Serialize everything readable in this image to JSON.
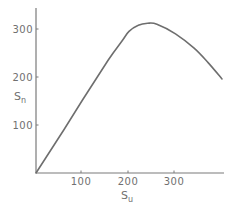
{
  "chart_data": {
    "type": "line",
    "title": "",
    "xlabel": "S_u",
    "ylabel": "S_n",
    "xlabel_main": "S",
    "xlabel_sub": "u",
    "ylabel_main": "S",
    "ylabel_sub": "n",
    "xticks": [
      "100",
      "200",
      "300"
    ],
    "yticks": [
      "100",
      "200",
      "300"
    ],
    "xlim": [
      0,
      405
    ],
    "ylim": [
      0,
      345
    ],
    "grid": false,
    "legend": null,
    "series": [
      {
        "name": "S_n vs S_u",
        "color": "#6e6e6e",
        "x": [
          0,
          60,
          100,
          155,
          185,
          200,
          220,
          240,
          260,
          300,
          340,
          370,
          400
        ],
        "y": [
          0,
          90,
          152,
          235,
          275,
          295,
          308,
          312,
          310,
          290,
          260,
          230,
          196
        ]
      }
    ]
  },
  "colors": {
    "axis": "#707070",
    "curve": "#6e6e6e",
    "background": "#ffffff"
  }
}
